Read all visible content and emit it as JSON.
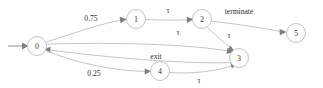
{
  "diagram": {
    "type": "state-machine",
    "canvas": {
      "width": 323,
      "height": 88
    },
    "colors": {
      "background": "#fefefe",
      "edge": "#b8b8b8",
      "node_stroke": "#bdbdbd",
      "node_fill": "#fdfdfd",
      "label_text": "#2e2e2e",
      "arrow": "#7f7f7f"
    },
    "nodes": [
      {
        "id": "n0",
        "label": "0",
        "cx": 37,
        "cy": 46,
        "r": 9.5
      },
      {
        "id": "n1",
        "label": "1",
        "cx": 136,
        "cy": 19,
        "r": 9.5
      },
      {
        "id": "n2",
        "label": "2",
        "cx": 202,
        "cy": 19,
        "r": 9.5
      },
      {
        "id": "n3",
        "label": "3",
        "cx": 239,
        "cy": 58,
        "r": 9.5
      },
      {
        "id": "n4",
        "label": "4",
        "cx": 160,
        "cy": 71,
        "r": 9.5
      },
      {
        "id": "n5",
        "label": "5",
        "cx": 296,
        "cy": 33,
        "r": 9.5
      }
    ],
    "start_marker": {
      "from_x": 8,
      "to_x": 27,
      "y": 46,
      "target": "n0"
    },
    "edges": [
      {
        "id": "e0_1",
        "from": "n0",
        "to": "n1",
        "label": "0.75",
        "label_x": 91,
        "label_y": 21
      },
      {
        "id": "e1_2",
        "from": "n1",
        "to": "n2",
        "label": "τ",
        "label_x": 168,
        "label_y": 13
      },
      {
        "id": "e2_5",
        "from": "n2",
        "to": "n5",
        "label": "terminate",
        "label_x": 239,
        "label_y": 14
      },
      {
        "id": "e2_3",
        "from": "n2",
        "to": "n3",
        "label": "τ",
        "label_x": 229,
        "label_y": 38
      },
      {
        "id": "e0_3",
        "from": "n0",
        "to": "n3",
        "label": "τ",
        "label_x": 178,
        "label_y": 35
      },
      {
        "id": "e3_0",
        "from": "n3",
        "to": "n0",
        "label": "exit",
        "label_x": 156,
        "label_y": 59
      },
      {
        "id": "e0_4",
        "from": "n0",
        "to": "n4",
        "label": "0.25",
        "label_x": 94,
        "label_y": 76
      },
      {
        "id": "e4_3",
        "from": "n4",
        "to": "n3",
        "label": "τ",
        "label_x": 199,
        "label_y": 83
      }
    ]
  }
}
